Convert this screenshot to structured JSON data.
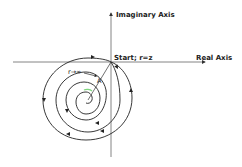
{
  "diagram": {
    "labels": {
      "imaginary_axis": "Imaginary Axis",
      "real_axis": "Real Axis",
      "start": "Start; r=z",
      "r_infinity": "r→∞",
      "point_a": "A"
    },
    "colors": {
      "line": "#222222",
      "axis": "#555555",
      "center_highlight": "#7fd67f",
      "background": "#ffffff"
    }
  }
}
